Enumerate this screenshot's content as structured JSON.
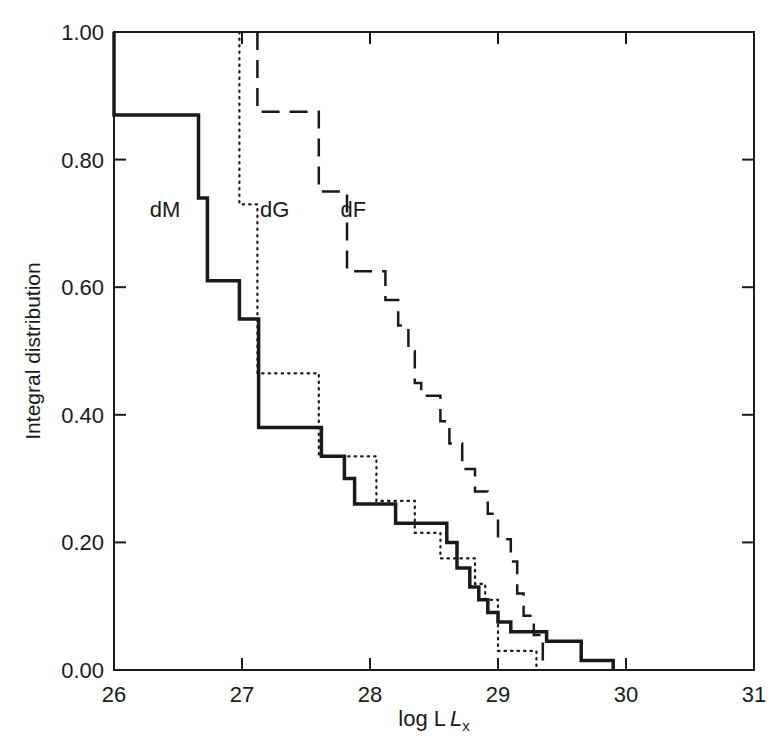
{
  "chart_data": {
    "type": "line",
    "subtype": "step",
    "title": "",
    "xlabel": "log L",
    "xlabel_sub": "x",
    "ylabel": "Integral distribution",
    "xlim": [
      26,
      31
    ],
    "ylim": [
      0,
      1
    ],
    "x_ticks": [
      "26",
      "27",
      "28",
      "29",
      "30",
      "31"
    ],
    "y_ticks": [
      "0.00",
      "0.20",
      "0.40",
      "0.60",
      "0.80",
      "1.00"
    ],
    "grid": false,
    "legend": "inline labels",
    "series": [
      {
        "name": "dM",
        "style": "solid",
        "points": [
          [
            26.0,
            1.0
          ],
          [
            26.0,
            0.87
          ],
          [
            26.66,
            0.87
          ],
          [
            26.66,
            0.74
          ],
          [
            26.73,
            0.74
          ],
          [
            26.73,
            0.61
          ],
          [
            26.98,
            0.61
          ],
          [
            26.98,
            0.55
          ],
          [
            27.13,
            0.55
          ],
          [
            27.13,
            0.38
          ],
          [
            27.62,
            0.38
          ],
          [
            27.62,
            0.335
          ],
          [
            27.8,
            0.335
          ],
          [
            27.8,
            0.3
          ],
          [
            27.88,
            0.3
          ],
          [
            27.88,
            0.26
          ],
          [
            28.2,
            0.26
          ],
          [
            28.2,
            0.23
          ],
          [
            28.6,
            0.23
          ],
          [
            28.6,
            0.2
          ],
          [
            28.68,
            0.2
          ],
          [
            28.68,
            0.16
          ],
          [
            28.78,
            0.16
          ],
          [
            28.78,
            0.13
          ],
          [
            28.85,
            0.13
          ],
          [
            28.85,
            0.11
          ],
          [
            28.92,
            0.11
          ],
          [
            28.92,
            0.09
          ],
          [
            29.0,
            0.09
          ],
          [
            29.0,
            0.075
          ],
          [
            29.1,
            0.075
          ],
          [
            29.1,
            0.06
          ],
          [
            29.38,
            0.06
          ],
          [
            29.38,
            0.045
          ],
          [
            29.65,
            0.045
          ],
          [
            29.65,
            0.015
          ],
          [
            29.9,
            0.015
          ],
          [
            29.9,
            0.0
          ]
        ]
      },
      {
        "name": "dG",
        "style": "dotted",
        "points": [
          [
            26.98,
            1.0
          ],
          [
            26.98,
            0.73
          ],
          [
            27.12,
            0.73
          ],
          [
            27.12,
            0.465
          ],
          [
            27.6,
            0.465
          ],
          [
            27.6,
            0.335
          ],
          [
            27.8,
            0.335
          ],
          [
            27.8,
            0.335
          ],
          [
            28.05,
            0.335
          ],
          [
            28.05,
            0.265
          ],
          [
            28.35,
            0.265
          ],
          [
            28.35,
            0.215
          ],
          [
            28.55,
            0.215
          ],
          [
            28.55,
            0.175
          ],
          [
            28.82,
            0.175
          ],
          [
            28.82,
            0.135
          ],
          [
            28.9,
            0.135
          ],
          [
            28.9,
            0.11
          ],
          [
            29.0,
            0.11
          ],
          [
            29.0,
            0.03
          ],
          [
            29.3,
            0.03
          ],
          [
            29.3,
            0.0
          ]
        ]
      },
      {
        "name": "dF",
        "style": "dashed",
        "points": [
          [
            27.12,
            1.0
          ],
          [
            27.12,
            0.875
          ],
          [
            27.6,
            0.875
          ],
          [
            27.6,
            0.75
          ],
          [
            27.82,
            0.75
          ],
          [
            27.82,
            0.625
          ],
          [
            28.12,
            0.625
          ],
          [
            28.12,
            0.58
          ],
          [
            28.22,
            0.58
          ],
          [
            28.22,
            0.54
          ],
          [
            28.3,
            0.54
          ],
          [
            28.3,
            0.5
          ],
          [
            28.35,
            0.5
          ],
          [
            28.35,
            0.45
          ],
          [
            28.4,
            0.45
          ],
          [
            28.4,
            0.43
          ],
          [
            28.55,
            0.43
          ],
          [
            28.55,
            0.39
          ],
          [
            28.62,
            0.39
          ],
          [
            28.62,
            0.355
          ],
          [
            28.72,
            0.355
          ],
          [
            28.72,
            0.315
          ],
          [
            28.82,
            0.315
          ],
          [
            28.82,
            0.28
          ],
          [
            28.92,
            0.28
          ],
          [
            28.92,
            0.245
          ],
          [
            29.0,
            0.245
          ],
          [
            29.0,
            0.205
          ],
          [
            29.1,
            0.205
          ],
          [
            29.1,
            0.17
          ],
          [
            29.15,
            0.17
          ],
          [
            29.15,
            0.12
          ],
          [
            29.2,
            0.12
          ],
          [
            29.2,
            0.085
          ],
          [
            29.28,
            0.085
          ],
          [
            29.28,
            0.055
          ],
          [
            29.35,
            0.055
          ],
          [
            29.35,
            0.0
          ]
        ]
      }
    ],
    "annotations": [
      {
        "text": "dM",
        "x": 26.28,
        "y": 0.71
      },
      {
        "text": "dG",
        "x": 27.14,
        "y": 0.71
      },
      {
        "text": "dF",
        "x": 27.77,
        "y": 0.71
      }
    ]
  }
}
